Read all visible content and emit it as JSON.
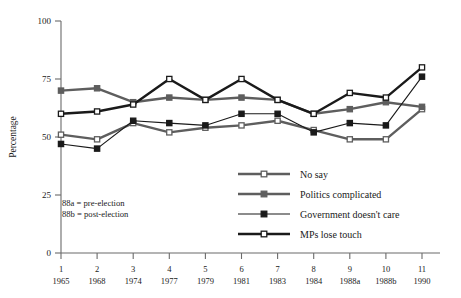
{
  "chart_data": {
    "type": "line",
    "title": "",
    "xlabel": "",
    "ylabel": "Percentage",
    "ylim": [
      0,
      100
    ],
    "yticks": [
      0,
      25,
      50,
      75,
      100
    ],
    "grid": false,
    "legend_position": "lower-right-inside",
    "categories": [
      "1",
      "2",
      "3",
      "4",
      "5",
      "6",
      "7",
      "8",
      "9",
      "10",
      "11"
    ],
    "x_index_labels": [
      "1",
      "2",
      "3",
      "4",
      "5",
      "6",
      "7",
      "8",
      "9",
      "10",
      "11"
    ],
    "x_year_labels": [
      "1965",
      "1968",
      "1974",
      "1977",
      "1979",
      "1981",
      "1983",
      "1984",
      "1988a",
      "1988b",
      "1990"
    ],
    "series": [
      {
        "name": "No say",
        "marker": "open-square",
        "color": "#5e5e5e",
        "line_weight": "thick",
        "values": [
          51,
          49,
          56,
          52,
          54,
          55,
          57,
          53,
          49,
          49,
          62
        ]
      },
      {
        "name": "Politics complicated",
        "marker": "filled-square",
        "color": "#5e5e5e",
        "line_weight": "thick",
        "values": [
          70,
          71,
          65,
          67,
          66,
          67,
          66,
          60,
          62,
          65,
          63
        ]
      },
      {
        "name": "Government doesn't care",
        "marker": "filled-square",
        "color": "#1a1a1a",
        "line_weight": "thin",
        "values": [
          47,
          45,
          57,
          56,
          55,
          60,
          60,
          52,
          56,
          55,
          76
        ]
      },
      {
        "name": "MPs lose touch",
        "marker": "open-square",
        "color": "#1a1a1a",
        "line_weight": "thick",
        "values": [
          60,
          61,
          64,
          75,
          66,
          75,
          66,
          60,
          69,
          67,
          80
        ]
      }
    ],
    "annotations": [
      "88a = pre-election",
      "88b = post-election"
    ]
  },
  "legend": {
    "items": [
      {
        "label": "No say"
      },
      {
        "label": "Politics complicated"
      },
      {
        "label": "Government doesn't care"
      },
      {
        "label": "MPs lose touch"
      }
    ]
  },
  "colors": {
    "gray_series": "#5e5e5e",
    "black_series": "#1a1a1a",
    "axis": "#6b6b6b",
    "background": "#ffffff"
  }
}
